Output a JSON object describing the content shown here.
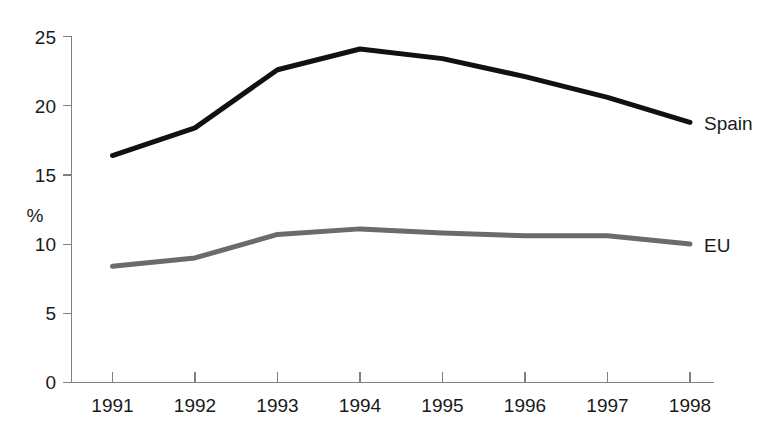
{
  "chart_data": {
    "type": "line",
    "title": "",
    "subtitle": "",
    "xlabel": "",
    "ylabel": "%",
    "categories": [
      "1991",
      "1992",
      "1993",
      "1994",
      "1995",
      "1996",
      "1997",
      "1998"
    ],
    "x": [
      1991,
      1992,
      1993,
      1994,
      1995,
      1996,
      1997,
      1998
    ],
    "xlim": [
      1991,
      1998
    ],
    "ylim": [
      0,
      25
    ],
    "y_ticks": [
      0,
      5,
      10,
      15,
      20,
      25
    ],
    "y_tick_labels": [
      "0",
      "5",
      "10",
      "15",
      "20",
      "25"
    ],
    "grid": false,
    "legend_position": "right-inline",
    "series": [
      {
        "name": "Spain",
        "color": "#111111",
        "line_width": 5,
        "values": [
          16.4,
          18.4,
          22.6,
          24.1,
          23.4,
          22.1,
          20.6,
          18.8
        ]
      },
      {
        "name": "EU",
        "color": "#6b6b6b",
        "line_width": 5,
        "values": [
          8.4,
          9.0,
          10.7,
          11.1,
          10.8,
          10.6,
          10.6,
          10.0
        ]
      }
    ]
  },
  "axes": {
    "y_axis_title": "%",
    "y_tick_labels": [
      "0",
      "5",
      "10",
      "15",
      "20",
      "25"
    ],
    "x_tick_labels": [
      "1991",
      "1992",
      "1993",
      "1994",
      "1995",
      "1996",
      "1997",
      "1998"
    ]
  },
  "legend": {
    "spain_label": "Spain",
    "eu_label": "EU"
  },
  "colors": {
    "spain_line": "#111111",
    "eu_line": "#6b6b6b",
    "axis": "#808080",
    "text": "#1a1a1a",
    "background": "#ffffff"
  }
}
